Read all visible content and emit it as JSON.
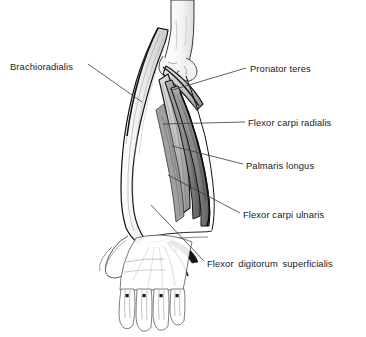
{
  "figure": {
    "line_color": "#000000",
    "text_color": "#1a1a1a",
    "background_color": "#ffffff",
    "muscle_fill": "#e8e8e8",
    "muscle_shade": "#9a9a9a",
    "tendon_color": "#111111"
  },
  "labels": [
    {
      "id": "brachioradialis",
      "text": "Brachioradialis",
      "side": "left"
    },
    {
      "id": "pronator_teres",
      "text": "Pronator teres",
      "side": "right"
    },
    {
      "id": "flexor_carpi_radialis",
      "text": "Flexor carpi radialis",
      "side": "right"
    },
    {
      "id": "palmaris_longus",
      "text": "Palmaris longus",
      "side": "right"
    },
    {
      "id": "flexor_carpi_ulnaris",
      "text": "Flexor carpi ulnaris",
      "side": "right"
    },
    {
      "id": "flexor_digitorum_superficialis",
      "text": "Flexor  digitorum  superficialis",
      "side": "right"
    }
  ],
  "structures": {
    "humerus": "humerus-shaft-and-condyles",
    "hand": "hand-outline-with-four-fingers-and-thumb",
    "wrist": "flexor-tendon-convergence"
  }
}
